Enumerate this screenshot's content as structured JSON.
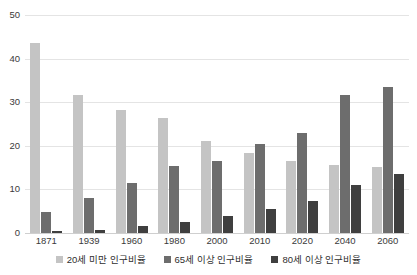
{
  "chart_data": {
    "type": "bar",
    "title": "",
    "subtitle": "",
    "xlabel": "",
    "ylabel": "",
    "ylim": [
      0,
      50
    ],
    "yticks": [
      0,
      10,
      20,
      30,
      40,
      50
    ],
    "grid": true,
    "legend_position": "bottom",
    "categories": [
      "1871",
      "1939",
      "1960",
      "1980",
      "2000",
      "2010",
      "2020",
      "2040",
      "2060"
    ],
    "series": [
      {
        "name": "20세 미만 인구비율",
        "color": "#c4c4c4",
        "values": [
          43.6,
          31.6,
          28.1,
          26.3,
          21.0,
          18.3,
          16.6,
          15.7,
          15.2
        ]
      },
      {
        "name": "65세 이상 인구비율",
        "color": "#6d6d6d",
        "values": [
          4.8,
          8.0,
          11.5,
          15.4,
          16.5,
          20.5,
          22.9,
          31.6,
          33.4
        ]
      },
      {
        "name": "80세 이상 인구비율",
        "color": "#3f3f3f",
        "values": [
          0.5,
          0.8,
          1.5,
          2.5,
          3.8,
          5.5,
          7.3,
          10.9,
          13.5
        ]
      }
    ]
  },
  "colors": {
    "series_light": "#c4c4c4",
    "series_mid": "#6d6d6d",
    "series_dark": "#3f3f3f",
    "gridline": "#e4e4e4",
    "text": "#3a3a3a",
    "background": "#ffffff"
  }
}
